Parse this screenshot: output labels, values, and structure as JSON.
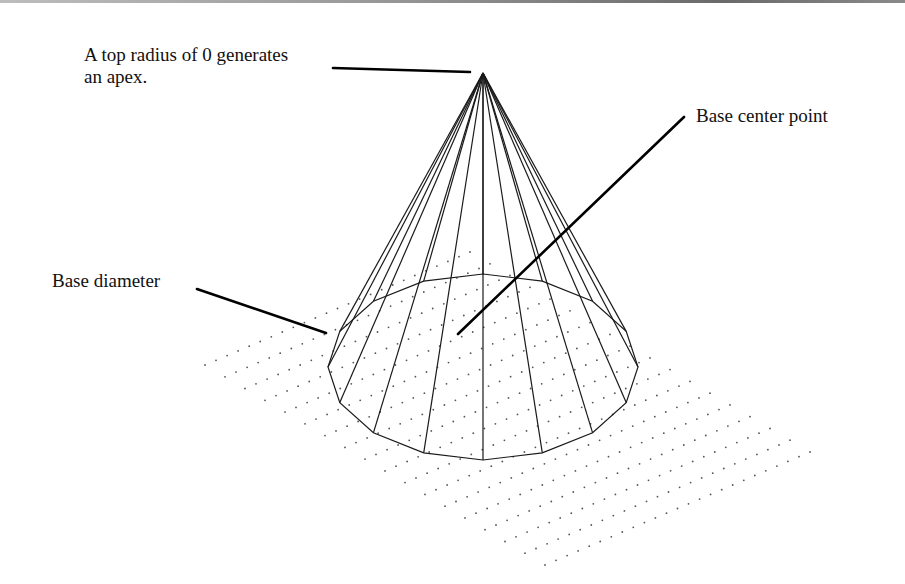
{
  "figure": {
    "type": "cone-wireframe-illustration",
    "labels": {
      "apex_line1": "A top radius of 0 generates",
      "apex_line2": "an apex.",
      "base_center": "Base center point",
      "base_diameter": "Base diameter"
    },
    "colors": {
      "background": "#ffffff",
      "wireframe": "#1a1a1a",
      "grid_dots": "#555555",
      "leader": "#000000"
    },
    "cone": {
      "apex": [
        483,
        73
      ],
      "base_center": [
        483,
        367
      ],
      "base_rx": 155,
      "base_ry": 93,
      "segments": 16
    },
    "grid": {
      "left": [
        205,
        365
      ],
      "top": [
        470,
        252
      ],
      "right": [
        787,
        415
      ],
      "bottom": [
        545,
        565
      ],
      "cols": 24,
      "rows": 17
    }
  }
}
